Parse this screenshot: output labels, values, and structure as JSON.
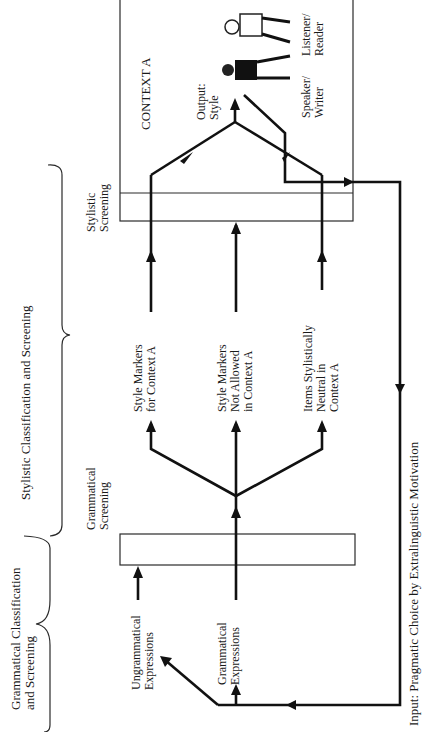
{
  "diagram": {
    "orientation": "rotated-90-ccw",
    "brackets": {
      "grammatical": "Grammatical Classification|and Screening",
      "stylistic": "Stylistic Classification and Screening"
    },
    "screens": {
      "grammatical": "Grammatical|Screening",
      "stylistic": "Stylistic|Screening"
    },
    "inputs": {
      "ungrammatical": "Ungrammatical|Expressions",
      "grammatical": "Grammatical|Expressions"
    },
    "classes": {
      "style_markers": "Style Markers|for Context A",
      "not_allowed": "Style Markers|Not Allowed|in Context A",
      "neutral": "Items Stylistically|Neutral in|Context A"
    },
    "context": {
      "title": "CONTEXT A",
      "output": "Output:|Style",
      "speaker": "Speaker/|Writer",
      "listener": "Listener/|Reader"
    },
    "input_label": "Input: Pragmatic Choice by Extralinguistic Motivation"
  }
}
